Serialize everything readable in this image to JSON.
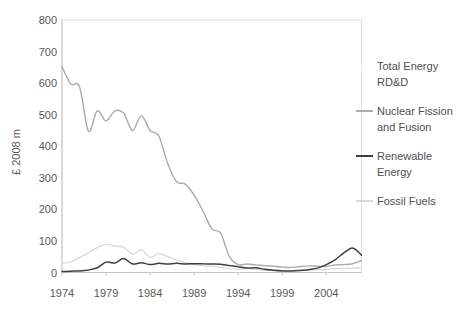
{
  "figure": {
    "background": "#ffffff",
    "tick_label_color": "#595959",
    "legend_text_color": "#4f4f4f",
    "axis_line_color": "#c4c4c4",
    "plot_border_color": "#e0e0e0"
  },
  "chart_data": {
    "type": "line",
    "title": "",
    "xlabel": "",
    "ylabel": "£ 2008 m",
    "ylim": [
      0,
      800
    ],
    "y_ticks": [
      0,
      100,
      200,
      300,
      400,
      500,
      600,
      700,
      800
    ],
    "x_range": [
      1974,
      2008
    ],
    "x_ticks": [
      1974,
      1979,
      1984,
      1989,
      1994,
      1999,
      2004
    ],
    "grid": false,
    "legend_position": "right",
    "x": [
      1974,
      1975,
      1976,
      1977,
      1978,
      1979,
      1980,
      1981,
      1982,
      1983,
      1984,
      1985,
      1986,
      1987,
      1988,
      1989,
      1990,
      1991,
      1992,
      1993,
      1994,
      1995,
      1996,
      1997,
      1998,
      1999,
      2000,
      2001,
      2002,
      2003,
      2004,
      2005,
      2006,
      2007,
      2008
    ],
    "series": [
      {
        "name": "Fossil Fuels",
        "color": "#d9d9d9",
        "stroke_width": 1.3,
        "values": [
          28,
          34,
          48,
          62,
          79,
          89,
          84,
          80,
          58,
          72,
          48,
          60,
          50,
          40,
          30,
          25,
          22,
          20,
          16,
          12,
          10,
          12,
          10,
          8,
          8,
          7,
          6,
          7,
          8,
          9,
          10,
          12,
          13,
          13,
          16
        ]
      },
      {
        "name": "Nuclear Fission and Fusion",
        "color": "#ababab",
        "stroke_width": 1.4,
        "values": [
          652,
          597,
          588,
          448,
          512,
          480,
          512,
          505,
          450,
          497,
          450,
          432,
          345,
          288,
          280,
          245,
          195,
          138,
          125,
          50,
          25,
          27,
          24,
          22,
          20,
          17,
          16,
          19,
          21,
          20,
          19,
          24,
          25,
          28,
          38
        ]
      },
      {
        "name": "Renewable Energy",
        "color": "#3f3f3f",
        "stroke_width": 1.5,
        "values": [
          3,
          4,
          5,
          8,
          15,
          33,
          30,
          44,
          27,
          31,
          25,
          29,
          27,
          29,
          27,
          28,
          28,
          27,
          26,
          22,
          18,
          14,
          15,
          10,
          7,
          5,
          5,
          6,
          9,
          14,
          25,
          40,
          62,
          78,
          55
        ]
      }
    ],
    "legend": [
      {
        "label_lines": [
          "Total Energy",
          "RD&D"
        ],
        "swatch_color": "#ffffff"
      },
      {
        "label_lines": [
          "Nuclear Fission",
          "and Fusion"
        ],
        "swatch_color": "#ababab"
      },
      {
        "label_lines": [
          "Renewable",
          "Energy"
        ],
        "swatch_color": "#3f3f3f"
      },
      {
        "label_lines": [
          "Fossil Fuels"
        ],
        "swatch_color": "#d9d9d9"
      }
    ]
  }
}
